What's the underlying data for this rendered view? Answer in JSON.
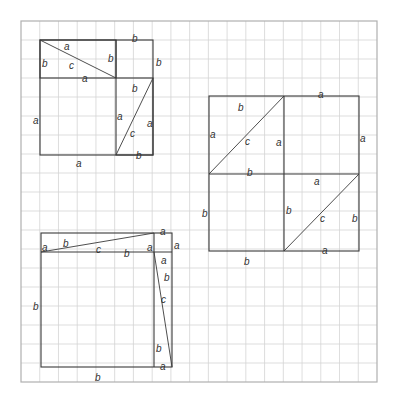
{
  "colors": {
    "background": "#ffffff",
    "grid": "#d4d4d4",
    "grid_border": "#b0b0b0",
    "figure_lines": "#3a3a3a",
    "labels": "#333333"
  },
  "grid": {
    "left": 21,
    "top": 21,
    "right": 377,
    "bottom": 382,
    "columns": 19,
    "rows": 19
  },
  "figures": [
    {
      "name": "figure-top-left",
      "description": "Square of side a+b split into a×a square, b×b square and two a×b rectangles each cut by diagonal c",
      "rects": [
        {
          "x1": 40,
          "y1": 40,
          "x2": 153,
          "y2": 155
        },
        {
          "x1": 40,
          "y1": 40,
          "x2": 116,
          "y2": 78
        },
        {
          "x1": 116,
          "y1": 78,
          "x2": 153,
          "y2": 155
        }
      ],
      "extra_lines": [
        {
          "x1": 116,
          "y1": 40,
          "x2": 116,
          "y2": 78
        }
      ],
      "diagonals": [
        {
          "x1": 40,
          "y1": 40,
          "x2": 116,
          "y2": 78
        },
        {
          "x1": 116,
          "y1": 155,
          "x2": 153,
          "y2": 78
        }
      ],
      "labels": [
        {
          "text": "b",
          "x": 132,
          "y": 38
        },
        {
          "text": "a",
          "x": 64,
          "y": 46
        },
        {
          "text": "b",
          "x": 42,
          "y": 63
        },
        {
          "text": "c",
          "x": 69,
          "y": 65
        },
        {
          "text": "b",
          "x": 108,
          "y": 58
        },
        {
          "text": "b",
          "x": 156,
          "y": 62
        },
        {
          "text": "a",
          "x": 82,
          "y": 78
        },
        {
          "text": "b",
          "x": 132,
          "y": 88
        },
        {
          "text": "a",
          "x": 33,
          "y": 120
        },
        {
          "text": "a",
          "x": 117,
          "y": 116
        },
        {
          "text": "a",
          "x": 147,
          "y": 123
        },
        {
          "text": "c",
          "x": 130,
          "y": 133
        },
        {
          "text": "b",
          "x": 136,
          "y": 155
        },
        {
          "text": "a",
          "x": 76,
          "y": 163
        }
      ]
    },
    {
      "name": "figure-right",
      "description": "Square of side a+b split into four quadrants; top-left and bottom-right rectangles cut by diagonal c",
      "rects": [
        {
          "x1": 209,
          "y1": 96,
          "x2": 359,
          "y2": 251
        }
      ],
      "extra_lines": [
        {
          "x1": 284,
          "y1": 96,
          "x2": 284,
          "y2": 251
        },
        {
          "x1": 209,
          "y1": 174,
          "x2": 359,
          "y2": 174
        }
      ],
      "diagonals": [
        {
          "x1": 209,
          "y1": 174,
          "x2": 284,
          "y2": 96
        },
        {
          "x1": 284,
          "y1": 251,
          "x2": 359,
          "y2": 174
        }
      ],
      "labels": [
        {
          "text": "a",
          "x": 318,
          "y": 94
        },
        {
          "text": "b",
          "x": 238,
          "y": 107
        },
        {
          "text": "a",
          "x": 210,
          "y": 134
        },
        {
          "text": "c",
          "x": 245,
          "y": 141
        },
        {
          "text": "a",
          "x": 276,
          "y": 142
        },
        {
          "text": "a",
          "x": 360,
          "y": 138
        },
        {
          "text": "b",
          "x": 247,
          "y": 172
        },
        {
          "text": "a",
          "x": 314,
          "y": 181
        },
        {
          "text": "b",
          "x": 202,
          "y": 213
        },
        {
          "text": "b",
          "x": 286,
          "y": 210
        },
        {
          "text": "c",
          "x": 320,
          "y": 218
        },
        {
          "text": "b",
          "x": 352,
          "y": 218
        },
        {
          "text": "a",
          "x": 322,
          "y": 250
        },
        {
          "text": "b",
          "x": 244,
          "y": 261
        }
      ]
    },
    {
      "name": "figure-bottom-left",
      "description": "Square of side b+a split into b×b square, a×a corner square and two thin b×a rectangles cut by diagonal c",
      "rects": [
        {
          "x1": 41,
          "y1": 233,
          "x2": 172,
          "y2": 367
        }
      ],
      "extra_lines": [
        {
          "x1": 41,
          "y1": 252,
          "x2": 172,
          "y2": 252
        },
        {
          "x1": 154,
          "y1": 233,
          "x2": 154,
          "y2": 367
        }
      ],
      "diagonals": [
        {
          "x1": 41,
          "y1": 252,
          "x2": 154,
          "y2": 233
        },
        {
          "x1": 154,
          "y1": 252,
          "x2": 172,
          "y2": 367
        }
      ],
      "labels": [
        {
          "text": "a",
          "x": 160,
          "y": 231
        },
        {
          "text": "a",
          "x": 42,
          "y": 247
        },
        {
          "text": "b",
          "x": 63,
          "y": 243
        },
        {
          "text": "c",
          "x": 96,
          "y": 249
        },
        {
          "text": "b",
          "x": 124,
          "y": 253
        },
        {
          "text": "a",
          "x": 147,
          "y": 247
        },
        {
          "text": "a",
          "x": 174,
          "y": 245
        },
        {
          "text": "a",
          "x": 161,
          "y": 260
        },
        {
          "text": "b",
          "x": 164,
          "y": 277
        },
        {
          "text": "b",
          "x": 33,
          "y": 306
        },
        {
          "text": "c",
          "x": 161,
          "y": 299
        },
        {
          "text": "b",
          "x": 156,
          "y": 348
        },
        {
          "text": "a",
          "x": 160,
          "y": 366
        },
        {
          "text": "b",
          "x": 95,
          "y": 377
        }
      ]
    }
  ]
}
